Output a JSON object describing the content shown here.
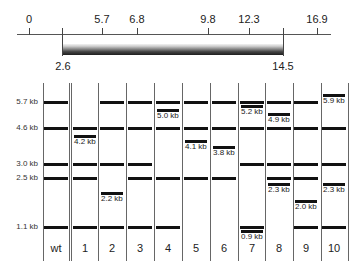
{
  "map": {
    "ticks": [
      {
        "label": "0",
        "x": 29
      },
      {
        "label": "5.7",
        "x": 102
      },
      {
        "label": "6.8",
        "x": 137
      },
      {
        "label": "9.8",
        "x": 208
      },
      {
        "label": "12.3",
        "x": 249
      },
      {
        "label": "16.9",
        "x": 317
      }
    ],
    "insert": {
      "start_label": "2.6",
      "end_label": "14.5",
      "start_x": 62,
      "end_x": 283
    }
  },
  "gel": {
    "size_markers": [
      {
        "label": "5.7 kb",
        "y": 102
      },
      {
        "label": "4.6 kb",
        "y": 128
      },
      {
        "label": "3.0 kb",
        "y": 164
      },
      {
        "label": "2.5 kb",
        "y": 178
      },
      {
        "label": "1.1 kb",
        "y": 227
      }
    ],
    "lanes": [
      {
        "label": "wt",
        "center": 56
      },
      {
        "label": "1",
        "center": 85
      },
      {
        "label": "2",
        "center": 112
      },
      {
        "label": "3",
        "center": 140
      },
      {
        "label": "4",
        "center": 168
      },
      {
        "label": "5",
        "center": 196
      },
      {
        "label": "6",
        "center": 224
      },
      {
        "label": "7",
        "center": 252
      },
      {
        "label": "8",
        "center": 279
      },
      {
        "label": "9",
        "center": 306
      },
      {
        "label": "10",
        "center": 334
      }
    ],
    "novel_bands": [
      {
        "lane": "1",
        "label": "4.2 kb",
        "y": 136
      },
      {
        "lane": "2",
        "label": "2.2 kb",
        "y": 193
      },
      {
        "lane": "4",
        "label": "5.0 kb",
        "y": 110
      },
      {
        "lane": "5",
        "label": "4.1 kb",
        "y": 141
      },
      {
        "lane": "6",
        "label": "3.8 kb",
        "y": 147
      },
      {
        "lane": "7",
        "label": "5.2 kb",
        "y": 106
      },
      {
        "lane": "7",
        "label": "0.9 kb",
        "y": 231
      },
      {
        "lane": "8",
        "label": "4.9 kb",
        "y": 114
      },
      {
        "lane": "8",
        "label": "2.3 kb",
        "y": 184
      },
      {
        "lane": "9",
        "label": "2.0 kb",
        "y": 201
      },
      {
        "lane": "10",
        "label": "5.9 kb",
        "y": 95
      },
      {
        "lane": "10",
        "label": "2.3 kb",
        "y": 184
      }
    ]
  }
}
